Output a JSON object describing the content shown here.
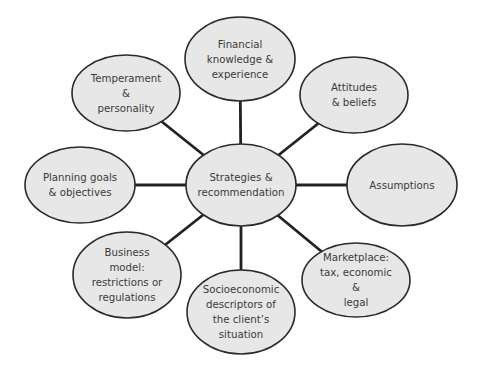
{
  "diagram": {
    "center": {
      "id": "strategies",
      "lines": [
        "Strategies &",
        "recommendation"
      ],
      "cx": 241,
      "cy": 185,
      "rx": 55,
      "ry": 41
    },
    "nodes": [
      {
        "id": "financial",
        "lines": [
          "Financial",
          "knowledge &",
          "experience"
        ],
        "cx": 240,
        "cy": 59,
        "rx": 55,
        "ry": 42
      },
      {
        "id": "attitudes",
        "lines": [
          "Attitudes",
          "& beliefs"
        ],
        "cx": 354,
        "cy": 95,
        "rx": 54,
        "ry": 38
      },
      {
        "id": "assumptions",
        "lines": [
          "Assumptions"
        ],
        "cx": 402,
        "cy": 185,
        "rx": 55,
        "ry": 41
      },
      {
        "id": "marketplace",
        "lines": [
          "Marketplace:",
          "tax, economic",
          "&",
          "legal"
        ],
        "cx": 356,
        "cy": 280,
        "rx": 54,
        "ry": 37
      },
      {
        "id": "socioeconomic",
        "lines": [
          "Socioeconomic",
          "descriptors of",
          "the client’s",
          "situation"
        ],
        "cx": 241,
        "cy": 312,
        "rx": 54,
        "ry": 42
      },
      {
        "id": "business",
        "lines": [
          "Business",
          "model:",
          "restrictions or",
          "regulations"
        ],
        "cx": 127,
        "cy": 275,
        "rx": 54,
        "ry": 43
      },
      {
        "id": "planning",
        "lines": [
          "Planning goals",
          "& objectives"
        ],
        "cx": 80,
        "cy": 185,
        "rx": 55,
        "ry": 38
      },
      {
        "id": "temperament",
        "lines": [
          "Temperament",
          "&",
          "personality"
        ],
        "cx": 126,
        "cy": 93,
        "rx": 54,
        "ry": 38
      }
    ],
    "colors": {
      "fill": "#e7e7e7",
      "stroke": "#2a2a2a",
      "connector": "#222222",
      "text": "#3a3a3a"
    }
  }
}
